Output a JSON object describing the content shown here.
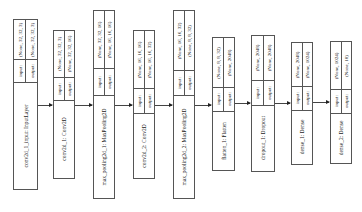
{
  "diagram": {
    "type": "keras-model-plot",
    "orientation": "left-to-right, text rotated 90°",
    "nodes": [
      {
        "label": "conv2d_1_input: InputLayer",
        "input_label": "input:",
        "output_label": "output:",
        "input_shape": "(None, 32, 32, 3)",
        "output_shape": "(None, 32, 32, 3)"
      },
      {
        "label": "conv2d_1: Conv2D",
        "input_label": "input:",
        "output_label": "output:",
        "input_shape": "(None, 32, 32, 3)",
        "output_shape": "(None, 32, 32, 16)"
      },
      {
        "label": "max_pooling2d_1: MaxPooling2D",
        "input_label": "input:",
        "output_label": "output:",
        "input_shape": "(None, 32, 32, 16)",
        "output_shape": "(None, 16, 16, 16)"
      },
      {
        "label": "conv2d_2: Conv2D",
        "input_label": "input:",
        "output_label": "output:",
        "input_shape": "(None, 16, 16, 16)",
        "output_shape": "(None, 16, 16, 32)"
      },
      {
        "label": "max_pooling2d_2: MaxPooling2D",
        "input_label": "input:",
        "output_label": "output:",
        "input_shape": "(None, 16, 16, 32)",
        "output_shape": "(None, 8, 8, 32)"
      },
      {
        "label": "flatten_1: Flatten",
        "input_label": "input:",
        "output_label": "output:",
        "input_shape": "(None, 8, 8, 32)",
        "output_shape": "(None, 2048)"
      },
      {
        "label": "dropout_1: Dropout",
        "input_label": "input:",
        "output_label": "output:",
        "input_shape": "(None, 2048)",
        "output_shape": "(None, 2048)"
      },
      {
        "label": "dense_1: Dense",
        "input_label": "input:",
        "output_label": "output:",
        "input_shape": "(None, 2048)",
        "output_shape": "(None, 1024)"
      },
      {
        "label": "dense_2: Dense",
        "input_label": "input:",
        "output_label": "output:",
        "input_shape": "(None, 1024)",
        "output_shape": "(None, 10)"
      }
    ],
    "edges": [
      [
        0,
        1
      ],
      [
        1,
        2
      ],
      [
        2,
        3
      ],
      [
        3,
        4
      ],
      [
        4,
        5
      ],
      [
        5,
        6
      ],
      [
        6,
        7
      ],
      [
        7,
        8
      ]
    ]
  },
  "colors": {
    "border": "#555555",
    "edge": "#444444",
    "background": "#ffffff"
  }
}
